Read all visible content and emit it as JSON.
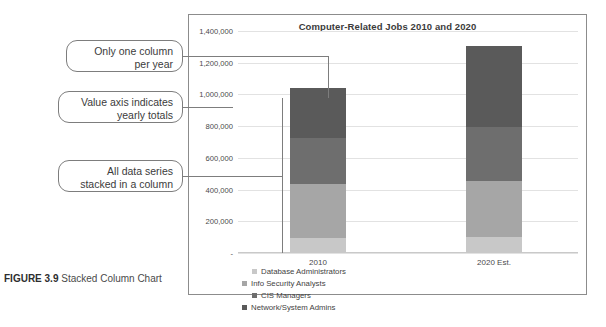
{
  "figure": {
    "number": "FIGURE 3.9",
    "caption": "Stacked Column Chart"
  },
  "callouts": [
    {
      "id": "one-column-per-year",
      "line1": "Only one column",
      "line2": "per year"
    },
    {
      "id": "value-axis",
      "line1": "Value axis indicates",
      "line2": "yearly totals"
    },
    {
      "id": "stacked-series",
      "line1": "All data series",
      "line2": "stacked in a column"
    }
  ],
  "chart_data": {
    "type": "bar",
    "subtype": "stacked-column",
    "title": "Computer-Related Jobs 2010 and 2020",
    "xlabel": "",
    "ylabel": "",
    "categories": [
      "2010",
      "2020 Est."
    ],
    "ylim": [
      0,
      1400000
    ],
    "ytick_values": [
      0,
      200000,
      400000,
      600000,
      800000,
      1000000,
      1200000,
      1400000
    ],
    "ytick_labels": [
      "-",
      "200,000",
      "400,000",
      "600,000",
      "800,000",
      "1,000,000",
      "1,200,000",
      "1,400,000"
    ],
    "grid": true,
    "legend_position": "bottom",
    "series": [
      {
        "name": "Database Administrators",
        "color": "#c8c8c8",
        "values": [
          95000,
          102000
        ]
      },
      {
        "name": "Info Security Analysts",
        "color": "#a6a6a6",
        "values": [
          340000,
          354000
        ]
      },
      {
        "name": "CIS Managers",
        "color": "#6e6e6e",
        "values": [
          292000,
          340000
        ]
      },
      {
        "name": "Network/System Admins",
        "color": "#5a5a5a",
        "values": [
          313000,
          509000
        ]
      }
    ],
    "totals": [
      1040000,
      1305000
    ]
  }
}
